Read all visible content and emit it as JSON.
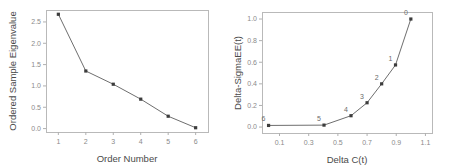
{
  "figure": {
    "title": "",
    "background": "#ffffff",
    "line_color": "#6e6e6e",
    "marker_color": "#3c3c3c",
    "frame_color": "#b9b9b9",
    "tick_label_color": "#8a8a8a",
    "axis_title_color": "#4a4a4a"
  },
  "chart_data": [
    {
      "type": "line",
      "panel": "left",
      "title": "",
      "xlabel": "Order Number",
      "ylabel": "Ordered Sample Eigenvalue",
      "x": [
        1,
        2,
        3,
        4,
        5,
        6
      ],
      "values": [
        2.68,
        1.35,
        1.04,
        0.69,
        0.29,
        0.02
      ],
      "xticks": [
        "1",
        "2",
        "3",
        "4",
        "5",
        "6"
      ],
      "xtick_values": [
        1,
        2,
        3,
        4,
        5,
        6
      ],
      "yticks": [
        "0.0",
        "0.5",
        "1.0",
        "1.5",
        "2.0",
        "2.5"
      ],
      "ytick_values": [
        0.0,
        0.5,
        1.0,
        1.5,
        2.0,
        2.5
      ],
      "xlim": [
        0.55,
        6.45
      ],
      "ylim": [
        -0.08,
        2.78
      ],
      "grid": false,
      "legend": false,
      "markers": "square",
      "point_labels": []
    },
    {
      "type": "line",
      "panel": "right",
      "title": "",
      "xlabel": "Delta C(t)",
      "ylabel": "Delta-SigmaEE(t)",
      "x": [
        0.025,
        0.405,
        0.59,
        0.7,
        0.8,
        0.895,
        1.0
      ],
      "values": [
        0.015,
        0.018,
        0.105,
        0.225,
        0.4,
        0.575,
        1.0
      ],
      "point_labels": [
        "6",
        "5",
        "4",
        "3",
        "2",
        "1",
        "0"
      ],
      "xticks": [
        "0.1",
        "0.3",
        "0.5",
        "0.7",
        "0.9",
        "1.1"
      ],
      "xtick_values": [
        0.1,
        0.3,
        0.5,
        0.7,
        0.9,
        1.1
      ],
      "yticks": [
        "0.0",
        "0.2",
        "0.4",
        "0.6",
        "0.8",
        "1.0"
      ],
      "ytick_values": [
        0.0,
        0.2,
        0.4,
        0.6,
        0.8,
        1.0
      ],
      "xlim": [
        -0.02,
        1.145
      ],
      "ylim": [
        -0.055,
        1.065
      ],
      "grid": false,
      "legend": false,
      "markers": "square"
    }
  ]
}
